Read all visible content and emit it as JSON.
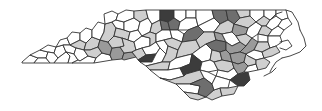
{
  "map": {
    "title": "",
    "region": "North Carolina counties",
    "type": "choropleth",
    "shades": {
      "white": "#ffffff",
      "light": "#cfcfcf",
      "mid": "#9a9a9a",
      "dark": "#6e6e6e",
      "darkest": "#3c3c3c"
    },
    "counties": [
      {
        "pts": "22,62 30,55 38,58 34,63 22,63",
        "shade": "white"
      },
      {
        "pts": "30,55 40,50 48,52 46,58 38,58",
        "shade": "white"
      },
      {
        "pts": "34,63 38,58 46,58 50,63",
        "shade": "white"
      },
      {
        "pts": "40,50 48,45 56,47 54,53 48,52",
        "shade": "white"
      },
      {
        "pts": "46,58 48,52 54,53 58,58 54,63 50,63",
        "shade": "white"
      },
      {
        "pts": "54,53 56,47 63,45 66,52 58,58",
        "shade": "white"
      },
      {
        "pts": "54,63 58,58 66,52 70,56 68,63",
        "shade": "white"
      },
      {
        "pts": "56,47 60,40 67,38 70,45 63,45",
        "shade": "white"
      },
      {
        "pts": "63,45 70,45 76,48 74,54 66,52",
        "shade": "white"
      },
      {
        "pts": "66,52 74,54 78,60 72,63 68,63 70,56",
        "shade": "white"
      },
      {
        "pts": "67,38 72,32 80,33 80,40 70,45",
        "shade": "white"
      },
      {
        "pts": "70,45 80,40 86,43 84,50 76,48",
        "shade": "light"
      },
      {
        "pts": "76,48 84,50 88,56 80,61 78,60 74,54",
        "shade": "white"
      },
      {
        "pts": "72,63 78,60 80,61 88,56 96,58 94,63",
        "shade": "white"
      },
      {
        "pts": "80,33 86,28 92,30 92,37 86,43 80,40",
        "shade": "white"
      },
      {
        "pts": "86,43 92,37 100,40 98,47 90,50 84,50",
        "shade": "light"
      },
      {
        "pts": "88,56 84,50 90,50 98,47 102,53 96,58",
        "shade": "light"
      },
      {
        "pts": "92,30 98,22 105,24 104,32 100,40 92,37",
        "shade": "white"
      },
      {
        "pts": "96,58 102,53 110,55 112,60 94,63",
        "shade": "white"
      },
      {
        "pts": "98,47 100,40 108,42 112,48 110,55 102,53",
        "shade": "mid"
      },
      {
        "pts": "104,32 105,24 112,22 116,28 114,36 108,42 100,40",
        "shade": "light"
      },
      {
        "pts": "105,24 104,14 112,11 118,14 116,20 112,22",
        "shade": "white"
      },
      {
        "pts": "112,22 116,20 124,22 124,30 116,28",
        "shade": "white"
      },
      {
        "pts": "110,55 112,48 120,47 124,53 122,59 112,60",
        "shade": "mid"
      },
      {
        "pts": "112,48 108,42 114,36 122,38 124,46 120,47",
        "shade": "light"
      },
      {
        "pts": "114,36 116,28 124,30 130,32 128,40 122,38",
        "shade": "light"
      },
      {
        "pts": "118,14 126,10 134,11 134,18 124,22 116,20",
        "shade": "white"
      },
      {
        "pts": "124,30 124,22 134,18 140,22 138,30 130,32",
        "shade": "white"
      },
      {
        "pts": "122,59 124,53 132,52 136,57 124,60",
        "shade": "mid"
      },
      {
        "pts": "124,46 122,38 128,40 134,42 136,50 132,52 124,53 120,47",
        "shade": "light"
      },
      {
        "pts": "128,40 130,32 138,30 142,36 134,42",
        "shade": "white"
      },
      {
        "pts": "134,11 146,10 148,18 140,22 134,18",
        "shade": "light"
      },
      {
        "pts": "138,30 140,22 148,18 152,24 150,32 142,36",
        "shade": "white"
      },
      {
        "pts": "134,42 142,36 150,38 150,46 142,48 136,50",
        "shade": "white"
      },
      {
        "pts": "136,57 132,52 136,50 142,48 146,55 138,60",
        "shade": "light"
      },
      {
        "pts": "146,10 160,10 160,20 152,24 148,18",
        "shade": "white"
      },
      {
        "pts": "150,32 152,24 160,20 162,30 156,34",
        "shade": "light"
      },
      {
        "pts": "150,38 142,36 150,32 156,34 156,42 150,46",
        "shade": "light"
      },
      {
        "pts": "142,48 150,46 156,42 160,48 156,54 146,55",
        "shade": "white"
      },
      {
        "pts": "138,60 146,55 156,54 152,62 140,62",
        "shade": "darkest"
      },
      {
        "pts": "140,62 152,62 156,54 160,48 166,54 162,62 146,66",
        "shade": "white"
      },
      {
        "pts": "160,10 174,10 174,18 168,22 160,20",
        "shade": "darkest"
      },
      {
        "pts": "160,20 168,22 170,30 162,30",
        "shade": "dark"
      },
      {
        "pts": "162,30 170,30 172,38 164,40 156,42 156,34",
        "shade": "white"
      },
      {
        "pts": "156,42 164,40 168,46 166,54 160,48",
        "shade": "white"
      },
      {
        "pts": "174,10 186,10 186,18 180,22 174,18",
        "shade": "white"
      },
      {
        "pts": "168,22 174,18 180,22 178,30 170,30",
        "shade": "dark"
      },
      {
        "pts": "170,30 178,30 184,34 182,42 172,38",
        "shade": "white"
      },
      {
        "pts": "164,40 172,38 182,42 178,50 168,46",
        "shade": "light"
      },
      {
        "pts": "166,54 168,46 178,50 176,58 170,62 162,62",
        "shade": "light"
      },
      {
        "pts": "146,66 162,62 170,62 168,70 150,70",
        "shade": "light"
      },
      {
        "pts": "186,10 196,10 196,18 186,18",
        "shade": "white"
      },
      {
        "pts": "180,22 186,18 196,18 198,26 188,30 178,30",
        "shade": "white"
      },
      {
        "pts": "184,34 188,30 198,26 204,32 196,40 182,42",
        "shade": "dark"
      },
      {
        "pts": "178,50 182,42 196,40 200,48 192,54 176,58",
        "shade": "light"
      },
      {
        "pts": "168,70 170,62 176,58 192,54 190,64 180,68",
        "shade": "white"
      },
      {
        "pts": "150,70 168,70 180,68 184,76 170,80 160,78",
        "shade": "white"
      },
      {
        "pts": "196,10 212,10 214,18 198,26 196,18",
        "shade": "white"
      },
      {
        "pts": "198,26 214,18 220,24 214,32 204,32",
        "shade": "white"
      },
      {
        "pts": "204,32 214,32 216,40 206,44 200,48 196,40",
        "shade": "light"
      },
      {
        "pts": "200,48 206,44 212,50 210,60 202,62 192,54",
        "shade": "white"
      },
      {
        "pts": "192,54 202,62 200,70 186,74 184,76 180,68 190,64",
        "shade": "darkest"
      },
      {
        "pts": "160,78 170,80 184,76 186,74 200,70 204,78 190,84 176,84",
        "shade": "light"
      },
      {
        "pts": "176,84 190,84 200,86 198,94 184,92",
        "shade": "white"
      },
      {
        "pts": "184,92 198,94 206,97 198,100 190,98",
        "shade": "light"
      },
      {
        "pts": "212,10 226,10 228,20 220,24 214,18",
        "shade": "dark"
      },
      {
        "pts": "226,10 236,10 240,18 234,24 228,20",
        "shade": "dark"
      },
      {
        "pts": "220,24 228,20 234,24 232,32 222,34 214,32",
        "shade": "light"
      },
      {
        "pts": "214,32 222,34 226,42 216,40",
        "shade": "mid"
      },
      {
        "pts": "216,40 226,42 226,50 220,52 212,50 206,44",
        "shade": "dark"
      },
      {
        "pts": "212,50 220,52 222,60 214,62 210,60",
        "shade": "light"
      },
      {
        "pts": "210,60 214,62 218,70 208,72 200,70 202,62",
        "shade": "white"
      },
      {
        "pts": "200,70 208,72 216,76 212,84 204,78",
        "shade": "white"
      },
      {
        "pts": "200,86 190,84 204,78 212,84 214,90 206,97 198,94",
        "shade": "dark"
      },
      {
        "pts": "206,97 214,90 220,88 222,96 212,100",
        "shade": "light"
      },
      {
        "pts": "236,10 250,10 250,16 240,18",
        "shade": "light"
      },
      {
        "pts": "240,18 250,16 256,22 248,28 234,24",
        "shade": "light"
      },
      {
        "pts": "234,24 248,28 246,34 236,36 232,32",
        "shade": "mid"
      },
      {
        "pts": "226,42 222,34 232,32 236,36 240,42 232,46",
        "shade": "white"
      },
      {
        "pts": "226,50 226,42 232,46 240,42 246,46 240,52 230,54",
        "shade": "mid"
      },
      {
        "pts": "222,60 220,52 226,50 230,54 232,62",
        "shade": "mid"
      },
      {
        "pts": "218,70 214,62 222,60 232,62 234,68 228,72",
        "shade": "light"
      },
      {
        "pts": "216,76 218,70 228,72 234,68 238,74 230,80",
        "shade": "white"
      },
      {
        "pts": "212,84 216,76 230,80 228,88 220,88 214,90",
        "shade": "white"
      },
      {
        "pts": "220,88 228,88 238,86 234,94 222,96",
        "shade": "light"
      },
      {
        "pts": "230,80 238,74 248,72 250,80 244,86 238,86",
        "shade": "darkest"
      },
      {
        "pts": "236,36 246,34 252,38 246,46 240,42",
        "shade": "light"
      },
      {
        "pts": "246,34 248,28 256,22 262,26 258,34 252,38",
        "shade": "white"
      },
      {
        "pts": "240,52 246,46 252,38 258,42 254,50 246,54",
        "shade": "mid"
      },
      {
        "pts": "232,62 230,54 240,52 246,54 244,62 238,64",
        "shade": "mid"
      },
      {
        "pts": "234,68 232,62 238,64 244,62 248,66 244,72 238,74",
        "shade": "mid"
      },
      {
        "pts": "248,72 244,72 248,66 256,64 258,70",
        "shade": "white"
      },
      {
        "pts": "250,10 264,10 264,16 256,22 250,16",
        "shade": "white"
      },
      {
        "pts": "256,22 264,16 270,20 266,26 262,26",
        "shade": "light"
      },
      {
        "pts": "262,26 266,26 272,30 268,36 258,34",
        "shade": "light"
      },
      {
        "pts": "258,34 268,36 268,42 258,42",
        "shade": "white"
      },
      {
        "pts": "258,42 268,42 270,48 262,52 254,50",
        "shade": "light"
      },
      {
        "pts": "254,50 262,52 264,58 256,60 248,56 246,54",
        "shade": "white"
      },
      {
        "pts": "244,62 246,54 248,56 256,60 256,64 248,66",
        "shade": "light"
      },
      {
        "pts": "256,64 256,60 264,58 270,62 266,68 258,70",
        "shade": "light"
      },
      {
        "pts": "264,10 276,10 276,16 270,20 264,16",
        "shade": "white"
      },
      {
        "pts": "270,20 276,16 282,20 278,26 272,30 266,26",
        "shade": "white"
      },
      {
        "pts": "272,30 278,26 284,30 280,36 268,36",
        "shade": "white"
      },
      {
        "pts": "268,42 268,36 280,36 282,42 276,46 270,48",
        "shade": "white"
      },
      {
        "pts": "262,52 270,48 276,46 280,52 272,56 264,58",
        "shade": "light"
      },
      {
        "pts": "276,10 286,10 288,18 282,20 276,16",
        "shade": "white"
      },
      {
        "pts": "282,20 288,18 292,24 284,30 278,26",
        "shade": "white"
      }
    ],
    "coastline": [
      "286,10 292,12 298,22 300,30",
      "300,30 304,38 306,46 300,52 290,56 282,58",
      "282,58 276,62 272,68 270,72",
      "264,76 272,72 276,68",
      "280,42 288,40 292,46 286,50 280,48",
      "270,20 276,14 282,12"
    ]
  }
}
